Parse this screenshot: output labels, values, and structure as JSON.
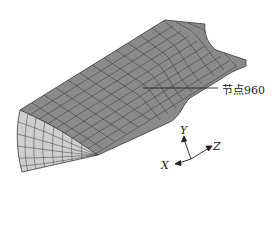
{
  "figure": {
    "caption_fragment": "",
    "annotation": {
      "label": "节点960",
      "target_point": [
        143,
        88
      ],
      "label_anchor": [
        222,
        88
      ]
    },
    "axes_triad": {
      "origin": [
        191,
        159
      ],
      "x_label": "X",
      "y_label": "Y",
      "z_label": "Z"
    },
    "colors": {
      "top_surface": "#8a8a8a",
      "front_face": "#cfcfcf",
      "mesh_lines": "#333333",
      "background": "#ffffff"
    }
  }
}
